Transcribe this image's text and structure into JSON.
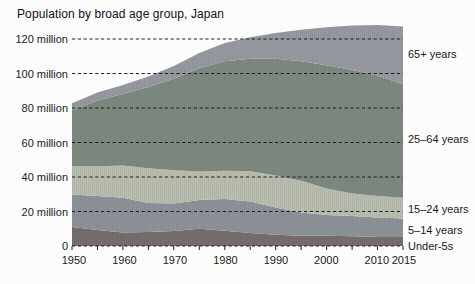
{
  "title": "Population by broad age group, Japan",
  "chart_data": {
    "type": "area",
    "stacked": true,
    "title": "Population by broad age group, Japan",
    "x": [
      1950,
      1955,
      1960,
      1965,
      1970,
      1975,
      1980,
      1985,
      1990,
      1995,
      2000,
      2005,
      2010,
      2015
    ],
    "x_unit": "year",
    "y_unit": "million people",
    "ylim": [
      0,
      130
    ],
    "y_gridlines": [
      0,
      20,
      40,
      60,
      80,
      100,
      120
    ],
    "grid_style": "dashed",
    "minor_x_tick_step": 5,
    "legend_position": "right-edge-labels",
    "series": [
      {
        "name": "under-5s",
        "label": "Under-5s",
        "color": "#766f6e",
        "values": [
          11.0,
          9.2,
          7.9,
          8.1,
          8.7,
          10.0,
          8.8,
          7.5,
          6.5,
          6.0,
          5.9,
          5.6,
          5.3,
          5.2
        ]
      },
      {
        "name": "5-14-years",
        "label": "5–14 years",
        "color": "#8e939a",
        "values": [
          18.8,
          19.7,
          20.1,
          16.9,
          16.0,
          16.7,
          18.5,
          18.3,
          15.8,
          13.5,
          12.1,
          11.8,
          11.3,
          10.7
        ]
      },
      {
        "name": "15-24-years",
        "label": "15–24 years",
        "color": "#b9bfb0",
        "values": [
          16.4,
          17.3,
          18.7,
          20.1,
          19.2,
          16.5,
          16.3,
          17.5,
          18.6,
          18.3,
          15.3,
          13.0,
          12.3,
          12.1
        ]
      },
      {
        "name": "25-64-years",
        "label": "25–64 years",
        "color": "#7e8a81",
        "values": [
          32.5,
          38.1,
          41.4,
          47.0,
          53.1,
          59.8,
          63.5,
          65.2,
          67.7,
          69.3,
          71.5,
          71.7,
          70.0,
          65.8
        ]
      },
      {
        "name": "65plus-years",
        "label": "65+ years",
        "color": "#979ba1",
        "values": [
          4.1,
          4.7,
          5.3,
          6.2,
          7.3,
          8.9,
          10.6,
          12.5,
          14.9,
          18.3,
          22.0,
          25.7,
          29.2,
          33.4
        ]
      }
    ]
  },
  "axes": {
    "y": {
      "labels": [
        "120 million",
        "100 million",
        "80 million",
        "60 million",
        "40 million",
        "20 million",
        "0"
      ]
    },
    "x": {
      "labels": [
        "1950",
        "1960",
        "1970",
        "1980",
        "1990",
        "2000",
        "2010",
        "2015"
      ]
    }
  },
  "style": {
    "gridline_color": "#1f1f1f",
    "background": "#fcfcfc"
  }
}
